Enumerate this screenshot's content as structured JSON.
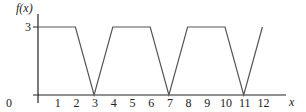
{
  "chart_data": {
    "type": "line",
    "title": "",
    "xlabel": "x",
    "ylabel": "f(x)",
    "x_ticks": [
      "0",
      "1",
      "2",
      "3",
      "4",
      "5",
      "6",
      "7",
      "8",
      "9",
      "10",
      "11",
      "12"
    ],
    "y_ticks": [
      "3"
    ],
    "xlim": [
      0,
      13
    ],
    "ylim": [
      0,
      3.5
    ],
    "grid": false,
    "series": [
      {
        "name": "f(x)",
        "x": [
          0,
          2,
          3,
          4,
          6,
          7,
          8,
          10,
          11,
          12
        ],
        "y": [
          3,
          3,
          0,
          3,
          3,
          0,
          3,
          3,
          0,
          3
        ]
      }
    ],
    "colors": {
      "line": "#555555",
      "axis": "#222222"
    }
  }
}
